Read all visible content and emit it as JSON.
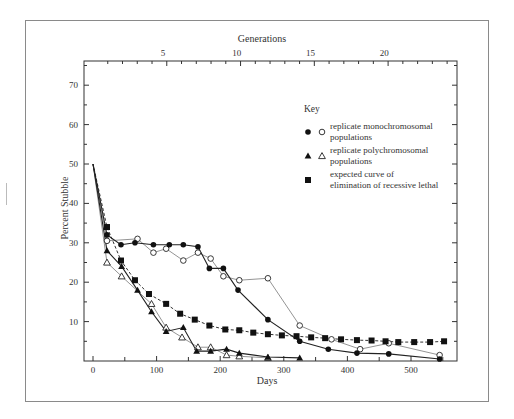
{
  "chart_data": {
    "type": "line",
    "title": "",
    "xlabel": "Days",
    "ylabel": "Percent Stubble",
    "x2label": "Generations",
    "xlim": [
      -15,
      570
    ],
    "ylim": [
      0,
      76
    ],
    "xticks": [
      0,
      100,
      200,
      300,
      400,
      500
    ],
    "yticks": [
      10,
      20,
      30,
      40,
      50,
      60,
      70
    ],
    "x2ticks": [
      {
        "label": "5",
        "days": 110
      },
      {
        "label": "10",
        "days": 226
      },
      {
        "label": "15",
        "days": 342
      },
      {
        "label": "20",
        "days": 458
      }
    ],
    "grid": false,
    "legend_title": "Key",
    "legend_position": "upper right",
    "legend": [
      {
        "markers": [
          "filled-circle",
          "open-circle"
        ],
        "line1": "replicate monochromosomal",
        "line2": "populations"
      },
      {
        "markers": [
          "filled-triangle",
          "open-triangle"
        ],
        "line1": "replicate polychromosomal",
        "line2": "populations"
      },
      {
        "markers": [
          "filled-square"
        ],
        "line1": "expected curve of",
        "line2": "elimination of recessive lethal"
      }
    ],
    "series": [
      {
        "name": "monochromosomal replicate A",
        "marker": "filled-circle",
        "line": "solid-dark",
        "x": [
          0,
          22,
          44,
          66,
          95,
          120,
          142,
          165,
          183,
          205,
          228,
          275,
          325,
          370,
          415,
          465,
          545
        ],
        "y": [
          50,
          32,
          29.5,
          30,
          29.5,
          29.5,
          29.5,
          29,
          23.5,
          23.5,
          18,
          10.5,
          5,
          3,
          2,
          1.8,
          0.5
        ]
      },
      {
        "name": "monochromosomal replicate B",
        "marker": "open-circle",
        "line": "solid-light",
        "x": [
          0,
          22,
          70,
          95,
          115,
          142,
          165,
          185,
          205,
          230,
          275,
          325,
          375,
          420,
          465,
          545
        ],
        "y": [
          50,
          30.5,
          31,
          27.5,
          28.5,
          25.5,
          27.5,
          26,
          21.5,
          20.5,
          21,
          9,
          5.5,
          3,
          4.5,
          1.5
        ]
      },
      {
        "name": "polychromosomal replicate A",
        "marker": "filled-triangle",
        "line": "solid-dark",
        "x": [
          0,
          22,
          45,
          70,
          92,
          115,
          142,
          163,
          185,
          210,
          230,
          275,
          325
        ],
        "y": [
          50,
          28,
          24,
          18,
          12.5,
          7.5,
          8.5,
          2.5,
          2.5,
          3,
          2,
          1,
          0.8
        ]
      },
      {
        "name": "polychromosomal replicate B",
        "marker": "open-triangle",
        "line": "solid-light",
        "x": [
          0,
          22,
          45,
          92,
          115,
          140,
          165,
          185,
          210,
          230,
          275
        ],
        "y": [
          50,
          25,
          21.5,
          14.5,
          8.5,
          6,
          3.5,
          3.5,
          1.5,
          1.2,
          0.8
        ]
      },
      {
        "name": "expected curve of elimination of recessive lethal",
        "marker": "filled-square",
        "line": "dashed",
        "x": [
          0,
          22,
          44,
          66,
          88,
          115,
          137,
          160,
          183,
          208,
          230,
          252,
          275,
          297,
          320,
          343,
          365,
          390,
          415,
          438,
          460,
          480,
          505,
          530,
          552
        ],
        "y": [
          50,
          34,
          25.5,
          20.5,
          17,
          14.5,
          12,
          10.5,
          9,
          8,
          7.8,
          7.2,
          6.8,
          6.5,
          6.3,
          6,
          5.8,
          5.5,
          5.3,
          5.2,
          5,
          4.8,
          4.8,
          4.8,
          5
        ]
      }
    ]
  }
}
